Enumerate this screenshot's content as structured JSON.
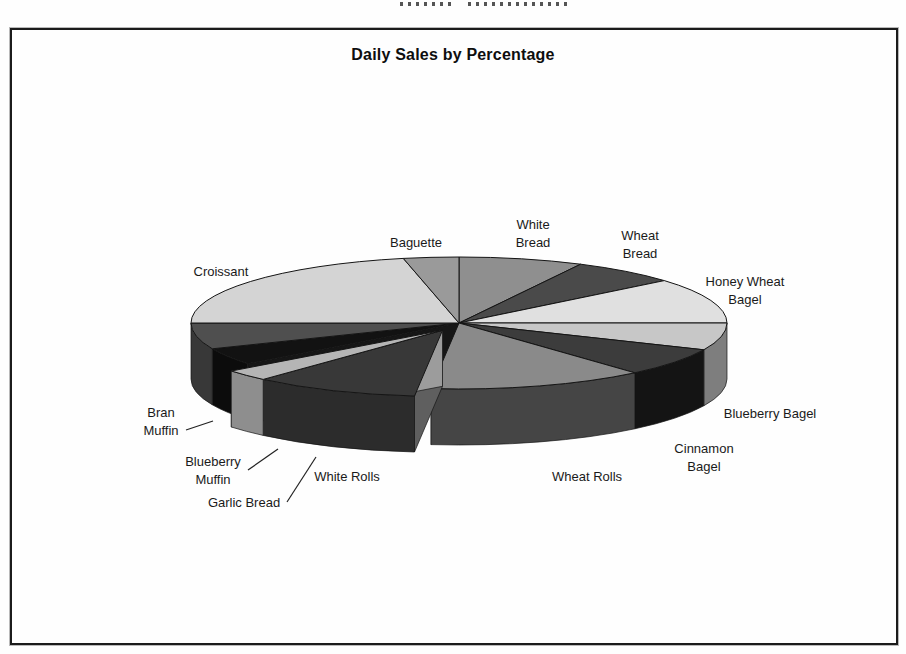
{
  "page": {
    "header_remnant_present": true
  },
  "chart_data": {
    "type": "pie",
    "is_3d": true,
    "exploded": true,
    "title": "Daily Sales by Percentage",
    "legend_position": "none",
    "data_labels": "category-names-only",
    "categories": [
      "White Bread",
      "Wheat Bread",
      "Honey Wheat Bagel",
      "Blueberry Bagel",
      "Cinnamon Bagel",
      "Wheat Rolls",
      "White Rolls",
      "Garlic Bread",
      "Blueberry Muffin",
      "Bran Muffin",
      "Croissant",
      "Baguette"
    ],
    "values_pct_estimated": [
      7.5,
      6.4,
      11.1,
      6.7,
      6.9,
      13.1,
      10.0,
      2.8,
      4.2,
      6.4,
      21.7,
      3.2
    ],
    "geometry": {
      "cx": 459,
      "cy": 323,
      "rx": 268,
      "ry": 66,
      "depth": 56,
      "explode": 34,
      "gap_faces": [
        {
          "deg": 186,
          "color": "#2e2e2e"
        },
        {
          "deg": 232,
          "color": "#161616"
        }
      ],
      "exploded_faces": [
        {
          "deg": 186,
          "color": "#5f5f5f"
        },
        {
          "deg": 232,
          "color": "#9c9c9c"
        }
      ]
    },
    "slices": [
      {
        "label": "White Bread",
        "label_lines": [
          "White",
          "Bread"
        ],
        "value_pct": 7.5,
        "start_deg": 0,
        "end_deg": 27,
        "top_color": "#8f8f8f",
        "side_color": "#5a5a5a",
        "exploded": false,
        "label_x": 533,
        "label_y": 234
      },
      {
        "label": "Wheat Bread",
        "label_lines": [
          "Wheat",
          "Bread"
        ],
        "value_pct": 6.4,
        "start_deg": 27,
        "end_deg": 50,
        "top_color": "#4a4a4a",
        "side_color": "#333333",
        "exploded": false,
        "label_x": 640,
        "label_y": 245
      },
      {
        "label": "Honey Wheat Bagel",
        "label_lines": [
          "Honey Wheat",
          "Bagel"
        ],
        "value_pct": 11.1,
        "start_deg": 50,
        "end_deg": 90,
        "top_color": "#e0e0e0",
        "side_color": "#a8a8a8",
        "exploded": false,
        "label_x": 745,
        "label_y": 291
      },
      {
        "label": "Blueberry Bagel",
        "label_lines": [
          "Blueberry Bagel"
        ],
        "value_pct": 6.7,
        "start_deg": 90,
        "end_deg": 114,
        "top_color": "#c7c7c7",
        "side_color": "#7e7e7e",
        "exploded": false,
        "label_x": 770,
        "label_y": 414
      },
      {
        "label": "Cinnamon Bagel",
        "label_lines": [
          "Cinnamon",
          "Bagel"
        ],
        "value_pct": 6.9,
        "start_deg": 114,
        "end_deg": 139,
        "top_color": "#3c3c3c",
        "side_color": "#141414",
        "exploded": false,
        "label_x": 704,
        "label_y": 458
      },
      {
        "label": "Wheat Rolls",
        "label_lines": [
          "Wheat Rolls"
        ],
        "value_pct": 13.1,
        "start_deg": 139,
        "end_deg": 186,
        "top_color": "#8a8a8a",
        "side_color": "#454545",
        "exploded": false,
        "label_x": 587,
        "label_y": 477
      },
      {
        "label": "White Rolls",
        "label_lines": [
          "White Rolls"
        ],
        "value_pct": 10.0,
        "start_deg": 186,
        "end_deg": 222,
        "top_color": "#383838",
        "side_color": "#2c2c2c",
        "exploded": true,
        "label_x": 347,
        "label_y": 477
      },
      {
        "label": "Garlic Bread",
        "label_lines": [
          "Garlic Bread"
        ],
        "value_pct": 2.8,
        "start_deg": 222,
        "end_deg": 232,
        "top_color": "#b5b5b5",
        "side_color": "#8e8e8e",
        "exploded": true,
        "label_x": 244,
        "label_y": 503,
        "leader": [
          [
            287,
            502
          ],
          [
            316,
            457
          ]
        ]
      },
      {
        "label": "Blueberry Muffin",
        "label_lines": [
          "Blueberry",
          "Muffin"
        ],
        "value_pct": 4.2,
        "start_deg": 232,
        "end_deg": 247,
        "top_color": "#121212",
        "side_color": "#0c0c0c",
        "exploded": false,
        "label_x": 213,
        "label_y": 471,
        "leader": [
          [
            248,
            470
          ],
          [
            278,
            449
          ]
        ]
      },
      {
        "label": "Bran Muffin",
        "label_lines": [
          "Bran",
          "Muffin"
        ],
        "value_pct": 6.4,
        "start_deg": 247,
        "end_deg": 270,
        "top_color": "#4f4f4f",
        "side_color": "#383838",
        "exploded": false,
        "label_x": 161,
        "label_y": 422,
        "leader": [
          [
            186,
            430
          ],
          [
            213,
            421
          ]
        ]
      },
      {
        "label": "Croissant",
        "label_lines": [
          "Croissant"
        ],
        "value_pct": 21.7,
        "start_deg": 270,
        "end_deg": 348,
        "top_color": "#d4d4d4",
        "side_color": "#9e9e9e",
        "exploded": false,
        "label_x": 221,
        "label_y": 272
      },
      {
        "label": "Baguette",
        "label_lines": [
          "Baguette"
        ],
        "value_pct": 3.2,
        "start_deg": 348,
        "end_deg": 360,
        "top_color": "#9a9a9a",
        "side_color": "#6f6f6f",
        "exploded": false,
        "label_x": 416,
        "label_y": 243
      }
    ]
  }
}
